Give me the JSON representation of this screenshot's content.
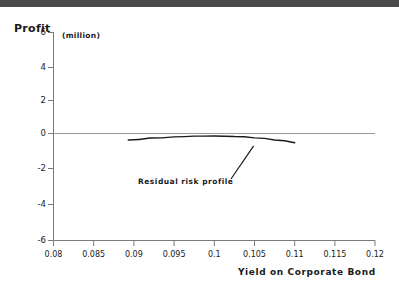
{
  "figure": {
    "background_color": "#ffffff",
    "top_band_color": "#4a4a4a",
    "axis_color": "#7a7a7a",
    "curve_color": "#1a1a1a",
    "text_color": "#1a1a1a"
  },
  "chart_data": {
    "type": "line",
    "title": "",
    "ylabel": "Profit",
    "yunit": "(million)",
    "xlabel": "Yield on Corporate Bond",
    "xlim": [
      0.08,
      0.12
    ],
    "ylim": [
      -6,
      6
    ],
    "grid": false,
    "legend": null,
    "xticks": [
      0.08,
      0.085,
      0.09,
      0.095,
      0.1,
      0.105,
      0.11,
      0.115,
      0.12
    ],
    "xticklabels": [
      "0.08",
      "0.085",
      "0.09",
      "0.095",
      "0.1",
      "0.105",
      "0.11",
      "0.115",
      "0.12"
    ],
    "yticks": [
      6,
      4,
      2,
      0,
      -2,
      -4,
      -6
    ],
    "yticklabels": [
      "6",
      "4",
      "2",
      "0",
      "-2",
      "-4",
      "-6"
    ],
    "zero_line": 0,
    "series": [
      {
        "name": "Residual risk profile",
        "x": [
          0.0893,
          0.092,
          0.095,
          0.0975,
          0.1,
          0.1025,
          0.105,
          0.1075,
          0.11
        ],
        "y": [
          -0.2,
          -0.09,
          -0.02,
          0.02,
          0.03,
          0.0,
          -0.08,
          -0.2,
          -0.36
        ]
      }
    ],
    "annotations": [
      {
        "text": "Residual risk profile",
        "x": 0.0955,
        "y": -2.05,
        "pointer_to_x": 0.1049,
        "pointer_to_y": -0.54
      }
    ]
  }
}
